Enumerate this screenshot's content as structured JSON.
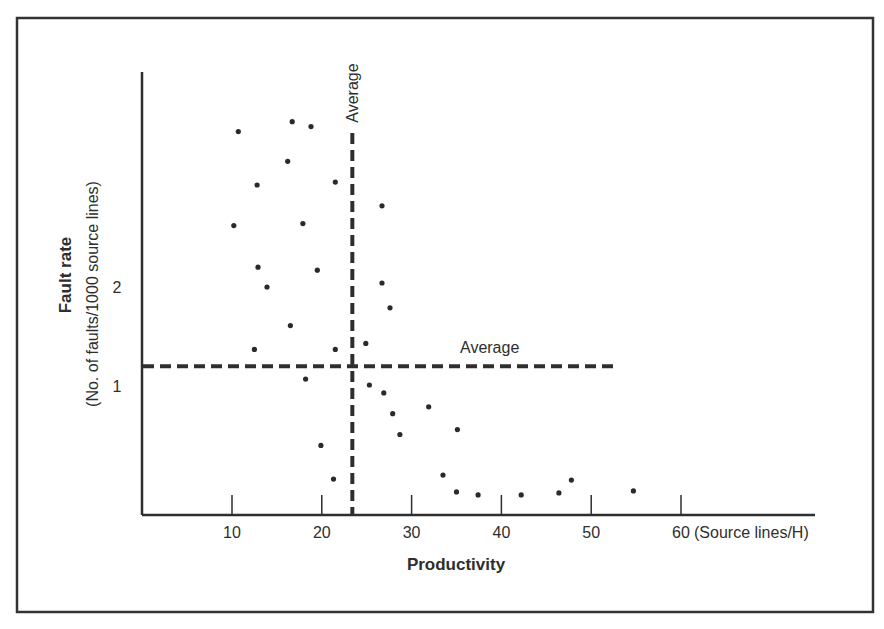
{
  "chart_data": {
    "type": "scatter",
    "title": "",
    "xlabel": "Productivity",
    "x_unit": "(Source lines/H)",
    "ylabel": "Fault rate",
    "ylabel_sub": "(No. of faults/1000 source lines)",
    "x_ticks": [
      10,
      20,
      30,
      40,
      50,
      60
    ],
    "x_tick_labels": [
      "10",
      "20",
      "30",
      "40",
      "50",
      "60"
    ],
    "y_ticks": [
      1,
      2
    ],
    "y_tick_labels": [
      "1",
      "2"
    ],
    "xlim": [
      0,
      75
    ],
    "ylim": [
      -0.3,
      4.2
    ],
    "grid": false,
    "legend": null,
    "reference_lines": [
      {
        "orientation": "vertical",
        "label": "Average",
        "x": 23.4,
        "style": "dashed"
      },
      {
        "orientation": "horizontal",
        "label": "Average",
        "y": 1.2,
        "x_end": 52.9,
        "style": "dashed"
      }
    ],
    "series": [
      {
        "name": "Projects",
        "points": [
          {
            "x": 10.7,
            "y": 3.57
          },
          {
            "x": 16.7,
            "y": 3.67
          },
          {
            "x": 18.8,
            "y": 3.62
          },
          {
            "x": 16.2,
            "y": 3.27
          },
          {
            "x": 12.8,
            "y": 3.03
          },
          {
            "x": 21.5,
            "y": 3.06
          },
          {
            "x": 26.7,
            "y": 2.82
          },
          {
            "x": 10.2,
            "y": 2.62
          },
          {
            "x": 17.9,
            "y": 2.64
          },
          {
            "x": 12.9,
            "y": 2.2
          },
          {
            "x": 19.5,
            "y": 2.17
          },
          {
            "x": 13.9,
            "y": 2.0
          },
          {
            "x": 26.7,
            "y": 2.04
          },
          {
            "x": 27.6,
            "y": 1.79
          },
          {
            "x": 16.5,
            "y": 1.61
          },
          {
            "x": 12.5,
            "y": 1.37
          },
          {
            "x": 21.5,
            "y": 1.37
          },
          {
            "x": 24.9,
            "y": 1.43
          },
          {
            "x": 18.2,
            "y": 1.07
          },
          {
            "x": 25.3,
            "y": 1.01
          },
          {
            "x": 26.9,
            "y": 0.93
          },
          {
            "x": 27.9,
            "y": 0.72
          },
          {
            "x": 31.9,
            "y": 0.79
          },
          {
            "x": 28.7,
            "y": 0.51
          },
          {
            "x": 35.1,
            "y": 0.56
          },
          {
            "x": 19.9,
            "y": 0.4
          },
          {
            "x": 21.3,
            "y": 0.06
          },
          {
            "x": 33.5,
            "y": 0.1
          },
          {
            "x": 35.0,
            "y": -0.07
          },
          {
            "x": 37.4,
            "y": -0.1
          },
          {
            "x": 42.2,
            "y": -0.1
          },
          {
            "x": 46.4,
            "y": -0.08
          },
          {
            "x": 47.8,
            "y": 0.05
          },
          {
            "x": 54.7,
            "y": -0.06
          }
        ]
      }
    ]
  },
  "labels": {
    "vertical_average": "Average",
    "horizontal_average": "Average",
    "x_axis_title": "Productivity",
    "y_axis_title": "Fault rate",
    "y_axis_subtitle": "(No. of faults/1000 source lines)",
    "x_unit": "(Source lines/H)"
  },
  "colors": {
    "ink": "#2e2e2e",
    "background": "#ffffff"
  }
}
